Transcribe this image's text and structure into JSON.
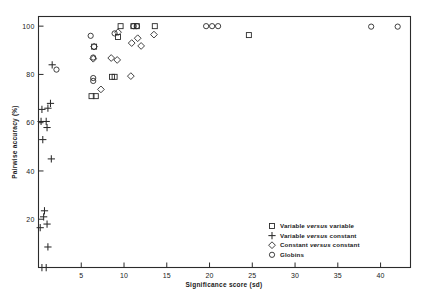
{
  "chart_data": {
    "type": "scatter",
    "title": "",
    "xlabel": "Significance score (sd)",
    "ylabel": "Pairwise accuracy (%)",
    "xlim": [
      0,
      43.5
    ],
    "ylim": [
      0,
      104
    ],
    "xticks": [
      5,
      10,
      15,
      20,
      25,
      30,
      35,
      40
    ],
    "yticks": [
      20,
      40,
      60,
      80,
      100
    ],
    "xtick_labels": [
      "5",
      "10",
      "15",
      "20",
      "25",
      "30",
      "35",
      "40"
    ],
    "ytick_labels": [
      "20",
      "40",
      "60",
      "80",
      "100"
    ],
    "grid": false,
    "legend_position": "lower-right",
    "series": [
      {
        "name": "Variable versus variable",
        "marker": "square",
        "points": [
          [
            6.2,
            71.0
          ],
          [
            6.7,
            71.0
          ],
          [
            6.5,
            91.5
          ],
          [
            8.6,
            79.0
          ],
          [
            8.9,
            79.0
          ],
          [
            9.6,
            100.0
          ],
          [
            11.1,
            100.0
          ],
          [
            11.5,
            100.0
          ],
          [
            13.6,
            100.0
          ],
          [
            9.3,
            95.5
          ],
          [
            24.6,
            96.3
          ]
        ]
      },
      {
        "name": "Variable versus constant",
        "marker": "plus",
        "points": [
          [
            0.4,
            0.0
          ],
          [
            0.9,
            0.0
          ],
          [
            1.1,
            8.5
          ],
          [
            1.0,
            18.0
          ],
          [
            0.6,
            21.0
          ],
          [
            0.7,
            23.5
          ],
          [
            0.2,
            16.5
          ],
          [
            1.5,
            45.0
          ],
          [
            0.5,
            53.0
          ],
          [
            1.0,
            58.0
          ],
          [
            0.3,
            60.5
          ],
          [
            0.9,
            60.5
          ],
          [
            0.4,
            65.5
          ],
          [
            1.1,
            66.0
          ],
          [
            1.4,
            68.0
          ],
          [
            1.6,
            84.0
          ]
        ]
      },
      {
        "name": "Constant versus constant",
        "marker": "diamond",
        "points": [
          [
            6.4,
            86.5
          ],
          [
            6.5,
            91.5
          ],
          [
            7.3,
            73.8
          ],
          [
            8.5,
            86.8
          ],
          [
            9.2,
            86.0
          ],
          [
            9.3,
            97.5
          ],
          [
            10.8,
            79.3
          ],
          [
            11.6,
            95.0
          ],
          [
            12.0,
            91.8
          ],
          [
            13.5,
            96.5
          ],
          [
            10.9,
            93.0
          ]
        ]
      },
      {
        "name": "Globins",
        "marker": "circle",
        "points": [
          [
            2.1,
            82.0
          ],
          [
            6.1,
            96.0
          ],
          [
            6.4,
            87.0
          ],
          [
            6.4,
            78.5
          ],
          [
            6.4,
            77.3
          ],
          [
            8.9,
            97.0
          ],
          [
            11.1,
            100.0
          ],
          [
            11.5,
            100.0
          ],
          [
            19.6,
            100.0
          ],
          [
            20.3,
            100.0
          ],
          [
            21.0,
            100.0
          ],
          [
            38.9,
            99.8
          ],
          [
            42.0,
            99.8
          ]
        ]
      }
    ]
  },
  "legend": {
    "items": [
      {
        "marker": "square",
        "prefix": "Variable ",
        "mid": "versus",
        "suffix": " variable"
      },
      {
        "marker": "plus",
        "prefix": "Variable ",
        "mid": "versus",
        "suffix": " constant"
      },
      {
        "marker": "diamond",
        "prefix": "Constant ",
        "mid": "versus",
        "suffix": " constant"
      },
      {
        "marker": "circle",
        "prefix": "Globins",
        "mid": "",
        "suffix": ""
      }
    ]
  },
  "colors": {
    "ink": "#2b2b2b",
    "background": "#ffffff"
  }
}
